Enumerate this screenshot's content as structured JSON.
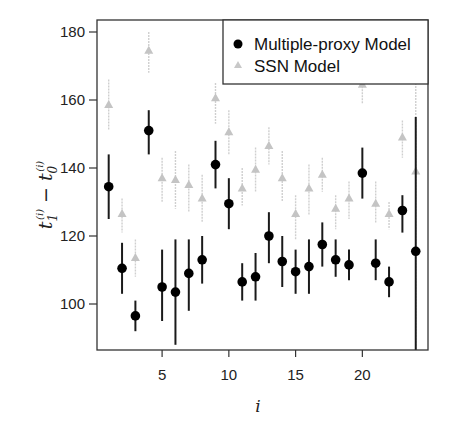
{
  "chart_data": {
    "type": "scatter",
    "title": "",
    "xlabel": "i",
    "ylabel": "t_1^(i) - t_0^(i)",
    "xlim": [
      0.2,
      25
    ],
    "ylim": [
      84,
      184
    ],
    "x_ticks": [
      5,
      10,
      15,
      20
    ],
    "y_ticks": [
      100,
      120,
      140,
      160,
      180
    ],
    "grid": false,
    "legend_position": "top-right",
    "x": [
      1,
      2,
      3,
      4,
      5,
      6,
      7,
      8,
      9,
      10,
      11,
      12,
      13,
      14,
      15,
      16,
      17,
      18,
      19,
      20,
      21,
      22,
      23,
      24
    ],
    "series": [
      {
        "name": "Multiple-proxy Model",
        "marker": "circle",
        "color": "#000000",
        "values": [
          134.5,
          110.5,
          96.5,
          151,
          105,
          103.5,
          109,
          113,
          141,
          129.5,
          106.5,
          108,
          120,
          112.5,
          109.5,
          111,
          117.5,
          113,
          111.5,
          138.5,
          112,
          106.5,
          127.5,
          115.5
        ],
        "lower": [
          125,
          103,
          92,
          144,
          95,
          88,
          98,
          106,
          134,
          122,
          101,
          101,
          112,
          105,
          103,
          103,
          111,
          108,
          107,
          131,
          107,
          102,
          121,
          84
        ],
        "upper": [
          144,
          118,
          101,
          157,
          116,
          119,
          119,
          120,
          148,
          137,
          112,
          115,
          127,
          120,
          116,
          119,
          124,
          119,
          116,
          146,
          119,
          111,
          132,
          155
        ]
      },
      {
        "name": "SSN Model",
        "marker": "triangle",
        "color": "#bdbdbd",
        "values": [
          158.5,
          126.5,
          113.5,
          174.5,
          137,
          136.5,
          135,
          131,
          160.5,
          150.5,
          134,
          139.5,
          146.5,
          137,
          126.5,
          134,
          138,
          128,
          131,
          164.5,
          129.5,
          126.5,
          149,
          139
        ],
        "lower": [
          151,
          121,
          108,
          168,
          130,
          128,
          127,
          124,
          153,
          144,
          129,
          133,
          141,
          130,
          119,
          126,
          133,
          122,
          125,
          159,
          124,
          122,
          143,
          84
        ],
        "upper": [
          166,
          131,
          119,
          180,
          143,
          145,
          141,
          138,
          165,
          157,
          140,
          146,
          152,
          145,
          132,
          141,
          143,
          132,
          136,
          172,
          136,
          130,
          154,
          184
        ]
      }
    ]
  },
  "legend": {
    "items": [
      {
        "label": "Multiple-proxy Model",
        "marker": "circle",
        "color": "#000000"
      },
      {
        "label": "SSN Model",
        "marker": "triangle",
        "color": "#bdbdbd"
      }
    ]
  },
  "axes": {
    "x_title": "i",
    "y_title_main": "t",
    "y_title_sub1": "1",
    "y_title_sub0": "0",
    "y_title_sup": "(i)",
    "y_title_minus": "−"
  }
}
